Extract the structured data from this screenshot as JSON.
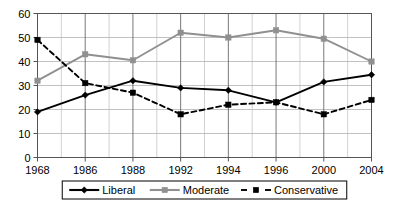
{
  "chart_data": {
    "type": "line",
    "title": "",
    "xlabel": "",
    "ylabel": "",
    "categories": [
      "1968",
      "1986",
      "1988",
      "1992",
      "1994",
      "1996",
      "2000",
      "2004"
    ],
    "x_tick_labels": [
      "1968",
      "1986",
      "1988",
      "1992",
      "1994",
      "1996",
      "2000",
      "2004"
    ],
    "y_tick_labels": [
      "0",
      "10",
      "20",
      "30",
      "40",
      "50",
      "60"
    ],
    "y_ticks": [
      0,
      10,
      20,
      30,
      40,
      50,
      60
    ],
    "ylim": [
      0,
      60
    ],
    "grid": "both",
    "grid_minor_vertical": true,
    "legend_position": "bottom",
    "series": [
      {
        "name": "Liberal",
        "values": [
          19,
          26,
          32,
          29,
          28,
          23,
          31.5,
          34.5
        ],
        "color": "#000000",
        "line_style": "solid",
        "marker": "diamond"
      },
      {
        "name": "Moderate",
        "values": [
          32,
          43,
          40.5,
          52,
          50,
          53,
          49.5,
          40
        ],
        "color": "#909090",
        "line_style": "solid",
        "marker": "square"
      },
      {
        "name": "Conservative",
        "values": [
          49,
          31,
          27,
          18,
          22,
          23,
          18,
          24
        ],
        "color": "#000000",
        "line_style": "dashed",
        "marker": "square"
      }
    ]
  },
  "axes": {
    "y_labels": [
      "60",
      "50",
      "40",
      "30",
      "20",
      "10",
      "0"
    ],
    "x_labels": [
      "1968",
      "1986",
      "1988",
      "1992",
      "1994",
      "1996",
      "2000",
      "2004"
    ]
  },
  "legend": {
    "items": [
      {
        "label": "Liberal"
      },
      {
        "label": "Moderate"
      },
      {
        "label": "Conservative"
      }
    ]
  },
  "colors": {
    "liberal": "#000000",
    "moderate": "#909090",
    "conservative": "#000000",
    "grid": "#b3b3b3",
    "axis": "#555555",
    "background": "#ffffff"
  }
}
